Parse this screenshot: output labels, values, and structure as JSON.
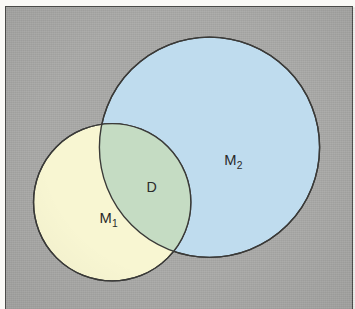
{
  "figure": {
    "kind": "venn-diagram",
    "background_color": "#a9a9a7",
    "border_color": "#4a4a48",
    "margin_color": "#faf9f6",
    "outline_color": "#3a3a38"
  },
  "chart_data": {
    "type": "diagram",
    "title": "",
    "sets": [
      {
        "id": "M1",
        "label": "M",
        "subscript": "1",
        "fill": "#f8f6d2",
        "cx": 108,
        "cy": 198,
        "r": 80,
        "label_x": 95,
        "label_y": 219
      },
      {
        "id": "M2",
        "label": "M",
        "subscript": "2",
        "fill": "#bfdcee",
        "cx": 207,
        "cy": 142,
        "r": 112,
        "label_x": 222,
        "label_y": 160
      }
    ],
    "intersection": {
      "id": "D",
      "label": "D",
      "fill": "#c5dcc3",
      "label_x": 143,
      "label_y": 188
    }
  }
}
